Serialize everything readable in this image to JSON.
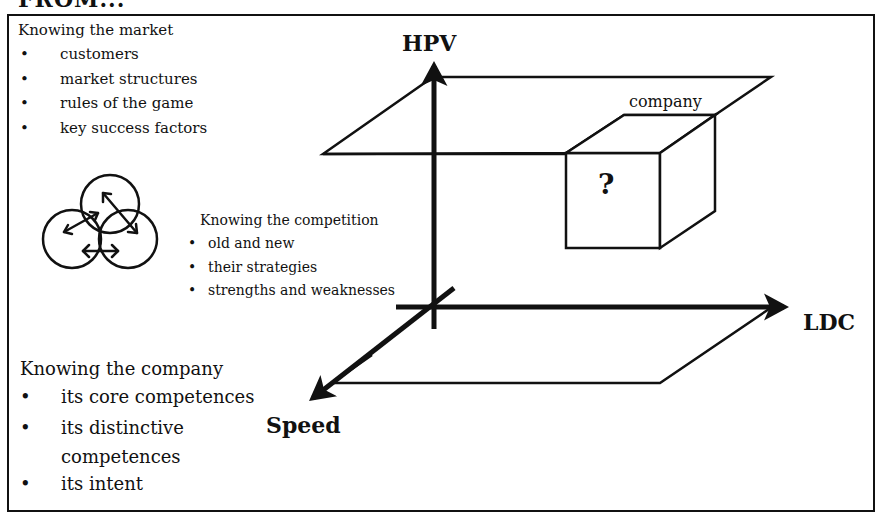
{
  "heading": "FROM...",
  "market": {
    "title": "Knowing the market",
    "items": [
      "customers",
      "market structures",
      "rules of the game",
      "key success factors"
    ]
  },
  "competition": {
    "title": "Knowing the competition",
    "items": [
      "old and new",
      "their strategies",
      "strengths and weaknesses"
    ]
  },
  "company_section": {
    "title": "Knowing the company",
    "items": [
      "its core competences",
      "its distinctive",
      "competences",
      "its intent"
    ]
  },
  "axes": {
    "vertical": "HPV",
    "horizontal": "LDC",
    "depth": "Speed"
  },
  "cube": {
    "label": "company",
    "symbol": "?"
  },
  "bullet_glyph": "•"
}
